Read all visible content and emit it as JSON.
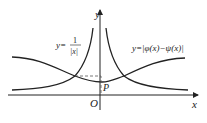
{
  "diagram": {
    "axis_labels": {
      "x": "x",
      "y": "y",
      "origin": "O"
    },
    "point_label": "P",
    "curve1_label": {
      "prefix": "y=",
      "numerator": "1",
      "denominator": "|x|"
    },
    "curve2_label": "y=|φ(x)−ψ(x)|"
  }
}
